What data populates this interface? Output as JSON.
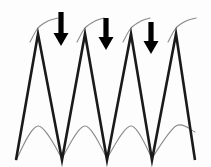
{
  "figure": {
    "title": "Sawtooth waveform trace with downward annotation arrows",
    "background_color": "#fdfdfd",
    "width": 211,
    "height": 167,
    "caption": ""
  },
  "style": {
    "waveform_color": "#1a1a1a",
    "waveform_stroke_width": 2.6,
    "envelope_color": "#8a8a8a",
    "envelope_stroke_width": 1.1,
    "arrow_color": "#000000"
  },
  "chart_data": {
    "type": "line",
    "title": "Sawtooth waveform trace with downward annotation arrows",
    "xlabel": "",
    "ylabel": "",
    "xlim": [
      0,
      211
    ],
    "ylim": [
      167,
      0
    ],
    "grid": false,
    "legend": "none",
    "series": [
      {
        "name": "sawtooth-waveform",
        "color": "#1a1a1a",
        "x": [
          16,
          38,
          62,
          85,
          107,
          131,
          152,
          176,
          195
        ],
        "y": [
          160,
          34,
          160,
          34,
          160,
          34,
          160,
          34,
          160
        ]
      },
      {
        "name": "envelope-upper-arc-1",
        "color": "#8a8a8a",
        "x": [
          30,
          38,
          48,
          58
        ],
        "y": [
          42,
          28,
          21,
          18
        ]
      },
      {
        "name": "envelope-upper-arc-2",
        "color": "#8a8a8a",
        "x": [
          77,
          85,
          95,
          104
        ],
        "y": [
          42,
          28,
          21,
          18
        ]
      },
      {
        "name": "envelope-upper-arc-3",
        "color": "#8a8a8a",
        "x": [
          123,
          131,
          141,
          150
        ],
        "y": [
          42,
          28,
          21,
          18
        ]
      },
      {
        "name": "envelope-upper-arc-4",
        "color": "#8a8a8a",
        "x": [
          168,
          176,
          186,
          196
        ],
        "y": [
          42,
          28,
          21,
          18
        ]
      },
      {
        "name": "envelope-lower-arc-1",
        "color": "#8a8a8a",
        "x": [
          16,
          38,
          62
        ],
        "y": [
          160,
          126,
          158
        ]
      },
      {
        "name": "envelope-lower-arc-2",
        "color": "#8a8a8a",
        "x": [
          62,
          85,
          107
        ],
        "y": [
          158,
          126,
          158
        ]
      },
      {
        "name": "envelope-lower-arc-3",
        "color": "#8a8a8a",
        "x": [
          107,
          131,
          152
        ],
        "y": [
          158,
          126,
          158
        ]
      },
      {
        "name": "envelope-lower-arc-4",
        "color": "#8a8a8a",
        "x": [
          152,
          176,
          195
        ],
        "y": [
          158,
          126,
          132
        ]
      }
    ],
    "annotations": [
      {
        "name": "arrow-1",
        "label": "",
        "x": 61,
        "y_top": 12,
        "y_tip": 46,
        "direction": "down"
      },
      {
        "name": "arrow-2",
        "label": "",
        "x": 106,
        "y_top": 18,
        "y_tip": 50,
        "direction": "down"
      },
      {
        "name": "arrow-3",
        "label": "",
        "x": 151,
        "y_top": 22,
        "y_tip": 54,
        "direction": "down"
      }
    ],
    "peaks_x": [
      38,
      85,
      131,
      176
    ],
    "valleys_x": [
      16,
      62,
      107,
      152,
      195
    ]
  }
}
